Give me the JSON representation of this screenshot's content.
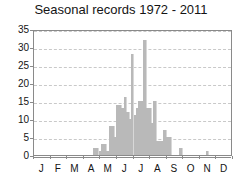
{
  "chart_data": {
    "type": "bar",
    "title": "Seasonal records 1972 - 2011",
    "xlabel": "",
    "ylabel": "",
    "ylim": [
      0,
      35
    ],
    "yticks": [
      0,
      5,
      10,
      15,
      20,
      25,
      30,
      35
    ],
    "grid": true,
    "legend": null,
    "categories": [
      "J",
      "F",
      "M",
      "A",
      "M",
      "J",
      "J",
      "A",
      "S",
      "O",
      "N",
      "D"
    ],
    "bar_color": "#b9b9b9",
    "note": "Histogram of record counts in sub-monthly bins; x positions given as fractional month index (0 = start of January, 12 = end of December).",
    "bins": [
      {
        "x": 3.55,
        "value": 2
      },
      {
        "x": 3.7,
        "value": 2
      },
      {
        "x": 3.9,
        "value": 1
      },
      {
        "x": 4.05,
        "value": 3
      },
      {
        "x": 4.2,
        "value": 3
      },
      {
        "x": 4.35,
        "value": 1
      },
      {
        "x": 4.5,
        "value": 8
      },
      {
        "x": 4.65,
        "value": 8
      },
      {
        "x": 4.8,
        "value": 5
      },
      {
        "x": 4.95,
        "value": 14
      },
      {
        "x": 5.1,
        "value": 14
      },
      {
        "x": 5.25,
        "value": 13
      },
      {
        "x": 5.4,
        "value": 16
      },
      {
        "x": 5.55,
        "value": 12
      },
      {
        "x": 5.7,
        "value": 10
      },
      {
        "x": 5.85,
        "value": 28
      },
      {
        "x": 6.0,
        "value": 11
      },
      {
        "x": 6.15,
        "value": 13
      },
      {
        "x": 6.3,
        "value": 15
      },
      {
        "x": 6.45,
        "value": 15
      },
      {
        "x": 6.6,
        "value": 32
      },
      {
        "x": 6.75,
        "value": 13
      },
      {
        "x": 6.9,
        "value": 13
      },
      {
        "x": 7.05,
        "value": 9
      },
      {
        "x": 7.2,
        "value": 15
      },
      {
        "x": 7.35,
        "value": 4
      },
      {
        "x": 7.5,
        "value": 4
      },
      {
        "x": 7.65,
        "value": 4
      },
      {
        "x": 7.8,
        "value": 7
      },
      {
        "x": 7.95,
        "value": 5
      },
      {
        "x": 8.1,
        "value": 5
      },
      {
        "x": 8.75,
        "value": 2
      },
      {
        "x": 10.35,
        "value": 1
      }
    ]
  }
}
